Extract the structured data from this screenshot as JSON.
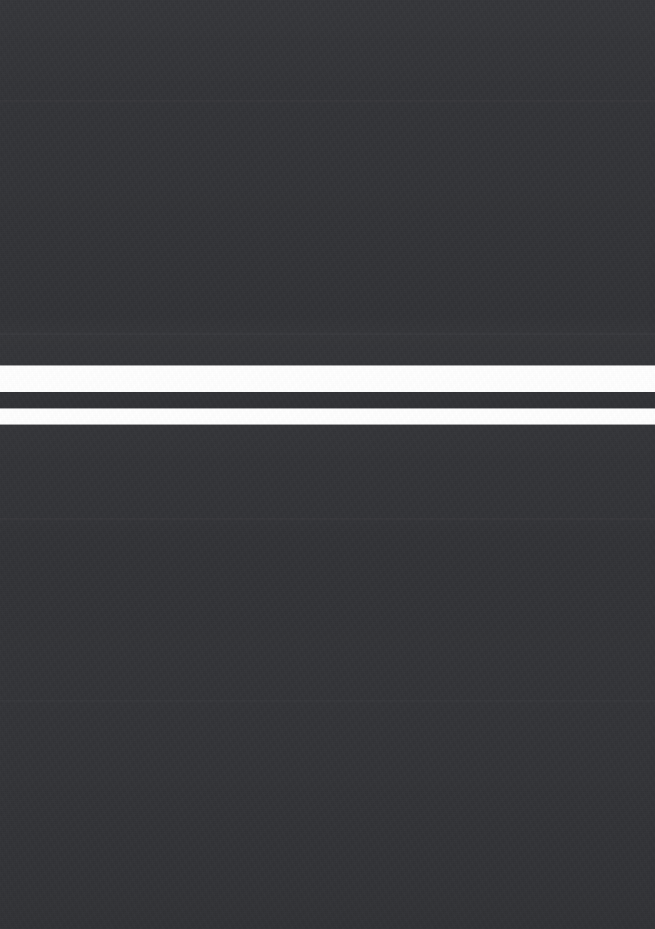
{
  "capture": {
    "description": "Blank dark screen capture with two bright horizontal bands",
    "state_label": "",
    "width_px": 655,
    "height_px": 929,
    "background_color": "#333438",
    "band_color": "#ffffff",
    "separator_color": "#303135",
    "has_visible_text": false,
    "has_visible_icons": false
  },
  "regions": {
    "upper_dark": {
      "label": "",
      "top_px": 0,
      "height_px": 366,
      "color": "#333438"
    },
    "lower_dark": {
      "label": "",
      "top_px": 424,
      "height_px": 505,
      "color": "#333438"
    }
  },
  "bands": [
    {
      "name": "upper-white-band",
      "label": "",
      "top_px": 366,
      "height_px": 26,
      "color": "#ffffff"
    },
    {
      "name": "dark-separator-band",
      "label": "",
      "top_px": 392,
      "height_px": 17,
      "color": "#303135"
    },
    {
      "name": "lower-white-band",
      "label": "",
      "top_px": 409,
      "height_px": 15,
      "color": "#ffffff"
    }
  ],
  "tone_seams": [
    {
      "name": "seam-upper",
      "top_px": 100,
      "opacity": 0.02
    },
    {
      "name": "seam-middle",
      "top_px": 333,
      "opacity": 0.024
    },
    {
      "name": "seam-lower",
      "top_px": 518,
      "opacity": 0.018
    },
    {
      "name": "seam-bottom",
      "top_px": 700,
      "opacity": 0.014
    }
  ]
}
